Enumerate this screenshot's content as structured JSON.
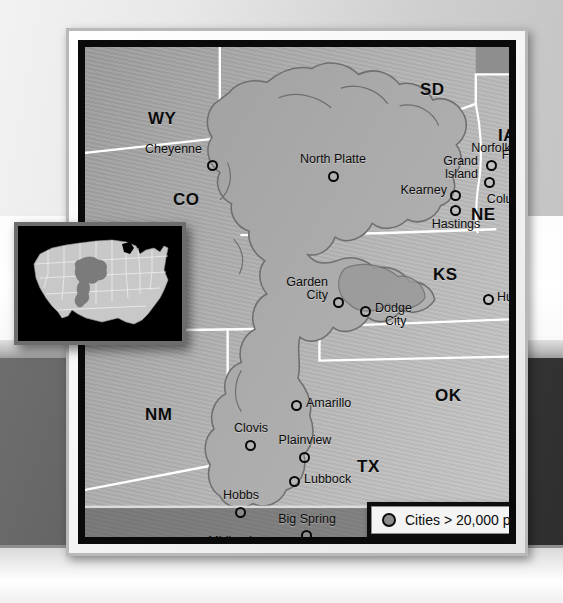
{
  "poster": {
    "title": "Ogallala Aquifer region map"
  },
  "map": {
    "state_labels": [
      {
        "abbr": "WY",
        "x": 63,
        "y": 62
      },
      {
        "abbr": "SD",
        "x": 335,
        "y": 33
      },
      {
        "abbr": "IA",
        "x": 413,
        "y": 79
      },
      {
        "abbr": "CO",
        "x": 88,
        "y": 143
      },
      {
        "abbr": "NE",
        "x": 386,
        "y": 158
      },
      {
        "abbr": "KS",
        "x": 348,
        "y": 218
      },
      {
        "abbr": "OK",
        "x": 350,
        "y": 339
      },
      {
        "abbr": "NM",
        "x": 60,
        "y": 358
      },
      {
        "abbr": "TX",
        "x": 272,
        "y": 410
      }
    ],
    "cities": [
      {
        "name": "Cheyenne",
        "dot_x": 122,
        "dot_y": 113,
        "label_x": 117,
        "label_y": 96,
        "align": "align-right",
        "lines": [
          "Cheyenne"
        ]
      },
      {
        "name": "North Platte",
        "dot_x": 243,
        "dot_y": 124,
        "label_x": 248,
        "label_y": 106,
        "align": "align-center",
        "lines": [
          "North Platte"
        ]
      },
      {
        "name": "Norfolk",
        "dot_x": 401,
        "dot_y": 113,
        "label_x": 400,
        "label_y": 95,
        "align": "align-center",
        "lines": [
          "Norfolk"
        ]
      },
      {
        "name": "Fremont",
        "dot_x": 435,
        "dot_y": 120,
        "label_x": 440,
        "label_y": 102,
        "align": "align-center",
        "lines": [
          "Fremont"
        ]
      },
      {
        "name": "Grand Island",
        "dot_x": 399,
        "dot_y": 130,
        "label_x": 383,
        "label_y": 109,
        "align": "align-right",
        "lines": [
          "Grand",
          "Island"
        ]
      },
      {
        "name": "Columbus",
        "dot_x": 424,
        "dot_y": 132,
        "label_x": 425,
        "label_y": 136,
        "align": "align-center",
        "lines": [
          "Columbus"
        ]
      },
      {
        "name": "Kearney",
        "dot_x": 365,
        "dot_y": 140,
        "label_x": 361,
        "label_y": 134,
        "align": "align-right",
        "lines": [
          "Kearney"
        ]
      },
      {
        "name": "Hastings",
        "dot_x": 365,
        "dot_y": 153,
        "label_x": 368,
        "label_y": 158,
        "align": "align-center",
        "lines": [
          "Hastings"
        ]
      },
      {
        "name": "Garden City",
        "dot_x": 248,
        "dot_y": 250,
        "label_x": 242,
        "label_y": 230,
        "align": "align-right",
        "lines": [
          "Garden",
          "City"
        ]
      },
      {
        "name": "Hutchinson",
        "dot_x": 398,
        "dot_y": 247,
        "label_x": 409,
        "label_y": 241,
        "align": "",
        "lines": [
          "Hutchinson"
        ]
      },
      {
        "name": "Dodge City",
        "dot_x": 275,
        "dot_y": 259,
        "label_x": 286,
        "label_y": 252,
        "align": "",
        "lines": [
          "Dodge",
          "City"
        ]
      },
      {
        "name": "Amarillo",
        "dot_x": 206,
        "dot_y": 353,
        "label_x": 218,
        "label_y": 346,
        "align": "",
        "lines": [
          "Amarillo"
        ]
      },
      {
        "name": "Clovis",
        "dot_x": 160,
        "dot_y": 393,
        "label_x": 161,
        "label_y": 374,
        "align": "align-center",
        "lines": [
          "Clovis"
        ]
      },
      {
        "name": "Plainview",
        "dot_x": 214,
        "dot_y": 405,
        "label_x": 215,
        "label_y": 386,
        "align": "align-center",
        "lines": [
          "Plainview"
        ]
      },
      {
        "name": "Lubbock",
        "dot_x": 204,
        "dot_y": 429,
        "label_x": 216,
        "label_y": 422,
        "align": "",
        "lines": [
          "Lubbock"
        ]
      },
      {
        "name": "Hobbs",
        "dot_x": 150,
        "dot_y": 460,
        "label_x": 148,
        "label_y": 442,
        "align": "align-center",
        "lines": [
          "Hobbs"
        ]
      },
      {
        "name": "Big Spring",
        "dot_x": 216,
        "dot_y": 483,
        "label_x": 212,
        "label_y": 466,
        "align": "align-center",
        "lines": [
          "Big Spring"
        ]
      },
      {
        "name": "Midland",
        "dot_x": 171,
        "dot_y": 491,
        "label_x": 165,
        "label_y": 485,
        "align": "align-right",
        "lines": [
          "Midland"
        ]
      }
    ]
  },
  "legend": {
    "text": "Cities > 20,000 people",
    "dot_color": "#8d8d8d"
  },
  "inset": {
    "description": "United States locator map with Ogallala Aquifer highlighted",
    "background_color": "#000000",
    "country_color": "#c7c7c7",
    "highlight_color": "#7d7d7d"
  },
  "colors": {
    "frame": "#0a0a0a",
    "mat": "#f6f6f6",
    "map_base": "#b3b3b3",
    "aquifer_outline": "#6f6f6f",
    "state_border": "#ffffff",
    "label_text": "#0b0b0b"
  }
}
